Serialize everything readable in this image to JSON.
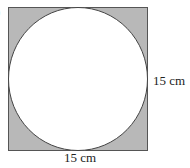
{
  "figure": {
    "shape": "circle inscribed in square",
    "square_side_label": "15 cm",
    "right_label": "15 cm",
    "bottom_label": "15 cm",
    "shaded_region": "square minus circle",
    "colors": {
      "shade": "#b8b8b8",
      "stroke": "#555555",
      "circle_fill": "#ffffff"
    }
  },
  "partial_mark": ")"
}
